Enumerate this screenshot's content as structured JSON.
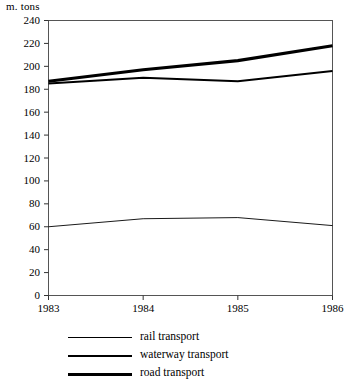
{
  "chart_data": {
    "type": "line",
    "title": "",
    "subtitle": "",
    "xlabel": "",
    "ylabel": "m. tons",
    "y_unit_label": "m. tons",
    "x": [
      "1983",
      "1984",
      "1985",
      "1986"
    ],
    "categories": [
      "1983",
      "1984",
      "1985",
      "1986"
    ],
    "xlim": [
      1983,
      1986
    ],
    "ylim": [
      0,
      240
    ],
    "y_ticks": [
      0,
      20,
      40,
      60,
      80,
      100,
      120,
      140,
      160,
      180,
      200,
      220,
      240
    ],
    "y_tick_labels": [
      "0",
      "20",
      "40",
      "60",
      "80",
      "100",
      "120",
      "140",
      "160",
      "180",
      "200",
      "220",
      "240"
    ],
    "x_ticks": [
      "1983",
      "1984",
      "1985",
      "1986"
    ],
    "grid": false,
    "legend_position": "bottom",
    "line_color": "#000000",
    "frame_color": "#555555",
    "series": [
      {
        "name": "rail transport",
        "legend_label": "rail transport",
        "line_width": 0.9,
        "values": [
          60,
          67,
          68,
          61
        ]
      },
      {
        "name": "waterway transport",
        "legend_label": "waterway transport",
        "line_width": 2.0,
        "values": [
          185,
          190,
          187,
          196
        ]
      },
      {
        "name": "road transport",
        "legend_label": "road transport",
        "line_width": 3.2,
        "values": [
          187,
          197,
          205,
          218
        ]
      }
    ]
  }
}
